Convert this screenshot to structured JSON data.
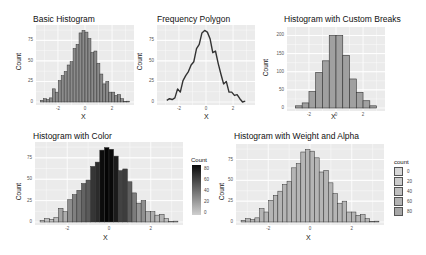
{
  "chart_data": [
    {
      "type": "bar",
      "title": "Basic Histogram",
      "xlabel": "X",
      "ylabel": "Count",
      "xticks": [
        "-2",
        "0",
        "2"
      ],
      "yticks": [
        "0",
        "25",
        "50",
        "75"
      ],
      "ylim": [
        0,
        90
      ],
      "xlim": [
        -3.4,
        3.4
      ],
      "bins": 30,
      "values": [
        2,
        4,
        3,
        5,
        16,
        12,
        26,
        32,
        37,
        45,
        49,
        65,
        70,
        84,
        87,
        85,
        77,
        60,
        62,
        47,
        34,
        22,
        25,
        12,
        12,
        8,
        9,
        4,
        0,
        1
      ],
      "fill": "#8c8c8c",
      "outline": "#333333"
    },
    {
      "type": "line",
      "title": "Frequency Polygon",
      "xlabel": "X",
      "ylabel": "Count",
      "xticks": [
        "-2",
        "0",
        "2"
      ],
      "yticks": [
        "0",
        "25",
        "50",
        "75"
      ],
      "ylim": [
        0,
        90
      ],
      "xlim": [
        -3.4,
        3.4
      ],
      "values": [
        2,
        4,
        3,
        5,
        16,
        12,
        26,
        32,
        37,
        45,
        49,
        65,
        70,
        84,
        87,
        85,
        77,
        60,
        62,
        47,
        34,
        22,
        25,
        12,
        12,
        8,
        9,
        4,
        0,
        1
      ],
      "color": "#333333"
    },
    {
      "type": "bar",
      "title": "Histogram with Custom Breaks",
      "xlabel": "X",
      "ylabel": "Count",
      "xticks": [
        "-2",
        "0",
        "2"
      ],
      "yticks": [
        "0",
        "50",
        "100",
        "150",
        "200"
      ],
      "ylim": [
        0,
        215
      ],
      "xlim": [
        -3.4,
        3.4
      ],
      "breaks": [
        -3,
        -2.5,
        -2,
        -1.5,
        -1,
        -0.5,
        0,
        0.5,
        1,
        1.5,
        2,
        2.5,
        3
      ],
      "values": [
        6,
        14,
        45,
        98,
        130,
        200,
        200,
        145,
        80,
        43,
        20,
        6
      ],
      "fill": "#a0a0a0",
      "outline": "#333333"
    },
    {
      "type": "bar",
      "title": "Histogram with Color",
      "xlabel": "X",
      "ylabel": "Count",
      "xticks": [
        "-2",
        "0",
        "2"
      ],
      "yticks": [
        "0",
        "25",
        "50",
        "75"
      ],
      "ylim": [
        0,
        90
      ],
      "xlim": [
        -3.4,
        3.4
      ],
      "values": [
        2,
        4,
        3,
        5,
        16,
        12,
        26,
        32,
        37,
        45,
        49,
        65,
        70,
        84,
        87,
        85,
        77,
        60,
        62,
        47,
        34,
        22,
        25,
        12,
        12,
        8,
        9,
        4,
        0,
        1
      ],
      "legend": {
        "title": "Count",
        "labels": [
          "80",
          "60",
          "40",
          "20",
          "0"
        ],
        "type": "gradient",
        "low": "#cfcfcf",
        "high": "#0a0a0a",
        "position": "right"
      }
    },
    {
      "type": "bar",
      "title": "Histogram with Weight and Alpha",
      "xlabel": "X",
      "ylabel": "Count",
      "xticks": [
        "-2",
        "0",
        "2"
      ],
      "yticks": [
        "0",
        "25",
        "50",
        "75"
      ],
      "ylim": [
        0,
        90
      ],
      "xlim": [
        -3.4,
        3.4
      ],
      "values": [
        2,
        4,
        3,
        5,
        16,
        12,
        26,
        32,
        37,
        45,
        49,
        65,
        70,
        84,
        87,
        85,
        77,
        60,
        62,
        47,
        34,
        22,
        25,
        12,
        12,
        8,
        9,
        4,
        0,
        1
      ],
      "legend": {
        "title": "count",
        "labels": [
          "0",
          "20",
          "40",
          "60",
          "80"
        ],
        "type": "binned",
        "position": "right"
      }
    }
  ],
  "panels": {
    "p1": {
      "title": "Basic Histogram",
      "xlabel": "X",
      "ylabel": "Count"
    },
    "p2": {
      "title": "Frequency Polygon",
      "xlabel": "X",
      "ylabel": "Count"
    },
    "p3": {
      "title": "Histogram with Custom Breaks",
      "xlabel": "X",
      "ylabel": "Count"
    },
    "p4": {
      "title": "Histogram with Color",
      "xlabel": "X",
      "ylabel": "Count",
      "legend_title": "Count"
    },
    "p5": {
      "title": "Histogram with Weight and Alpha",
      "xlabel": "X",
      "ylabel": "Count",
      "legend_title": "count"
    }
  }
}
